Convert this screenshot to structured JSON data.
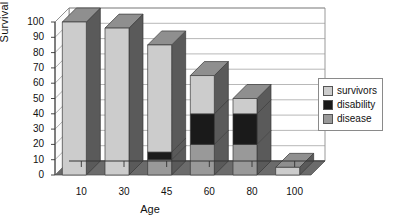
{
  "chart_data": {
    "type": "bar",
    "subtype": "stacked-3d-column",
    "title": "",
    "xlabel": "Age",
    "ylabel": "Survival",
    "categories": [
      "10",
      "30",
      "45",
      "60",
      "80",
      "100"
    ],
    "ylim": [
      0,
      100
    ],
    "yticks": [
      100,
      90,
      80,
      70,
      60,
      50,
      40,
      30,
      20,
      10,
      0
    ],
    "grid": true,
    "grid_axis": "y",
    "legend_position": "right",
    "series": [
      {
        "name": "survivors",
        "color": "#cccccc",
        "values": [
          100,
          96,
          70,
          25,
          10,
          5
        ]
      },
      {
        "name": "disability",
        "color": "#1a1a1a",
        "values": [
          0,
          0,
          5,
          20,
          20,
          0
        ]
      },
      {
        "name": "disease",
        "color": "#999999",
        "values": [
          0,
          0,
          10,
          20,
          20,
          0
        ]
      }
    ],
    "stack_order_bottom_to_top": [
      "disease",
      "disability",
      "survivors"
    ],
    "stack_totals": [
      100,
      96,
      85,
      65,
      50,
      5
    ]
  },
  "legend": {
    "items": [
      {
        "label": "survivors",
        "color": "#cccccc"
      },
      {
        "label": "disability",
        "color": "#1a1a1a"
      },
      {
        "label": "disease",
        "color": "#999999"
      }
    ]
  },
  "colors": {
    "survivors": "#cccccc",
    "disability": "#1a1a1a",
    "disease": "#999999",
    "side_shade": "#5a5a5a",
    "top_shade": "#8f8f8f",
    "floor": "#6b6b6b",
    "grid": "#9a9a9a",
    "axis": "#333333"
  }
}
